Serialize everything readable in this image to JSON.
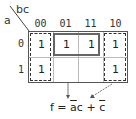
{
  "kmap": {
    "col_var": "bc",
    "row_var": "a",
    "columns": [
      "00",
      "01",
      "11",
      "10"
    ],
    "rows": [
      "0",
      "1"
    ],
    "cells": [
      [
        "1",
        "1",
        "1",
        "1"
      ],
      [
        "1",
        "",
        "",
        "1"
      ]
    ],
    "groups": [
      {
        "name": "a-bar-c",
        "style": "solid",
        "cells": [
          [
            0,
            1
          ],
          [
            0,
            2
          ]
        ]
      },
      {
        "name": "c-bar-left",
        "style": "dashed",
        "cells": [
          [
            0,
            0
          ],
          [
            1,
            0
          ]
        ]
      },
      {
        "name": "c-bar-right",
        "style": "dashed",
        "cells": [
          [
            0,
            3
          ],
          [
            1,
            3
          ]
        ]
      }
    ]
  },
  "formula": {
    "lhs": "f = ",
    "term1_bar": "a",
    "term1_rest": "c",
    "plus": " + ",
    "term2_bar": "c"
  },
  "colors": {
    "grid_border": "#555555",
    "inner_lines": "#bbbbbb",
    "solid_group": "#666666",
    "dashed_group": "#333333"
  }
}
